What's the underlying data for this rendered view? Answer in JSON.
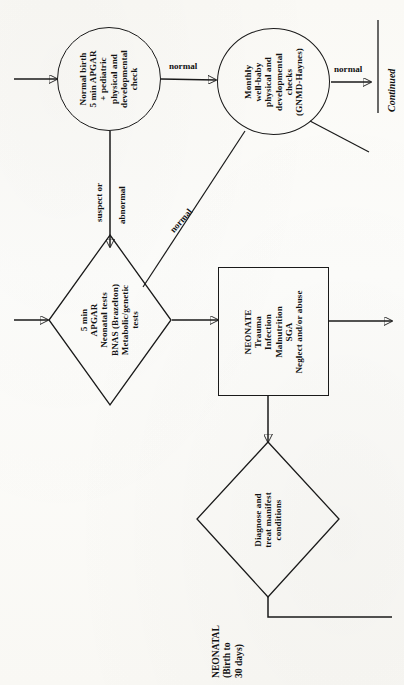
{
  "diagram": {
    "orientation": "text-rotated-90-counterclockwise",
    "ink_color": "#1a1a1a",
    "paper_color": "#fdfdfb",
    "nodes": [
      {
        "id": "normal-birth",
        "shape": "circle",
        "lines": [
          "Normal birth",
          "5 min APGAR",
          "+ pediatric",
          "physical and",
          "developmental",
          "check"
        ]
      },
      {
        "id": "monthly-checks",
        "shape": "circle",
        "lines": [
          "Monthly",
          "well-baby",
          "physical and",
          "developmental",
          "checks",
          "(GNMD-Haynes)"
        ]
      },
      {
        "id": "neonatal-tests",
        "shape": "diamond",
        "lines": [
          "5 min",
          "APGAR",
          "Neonatal tests",
          "BNAS (Brazelton)",
          "Metabolic/genetic",
          "tests"
        ]
      },
      {
        "id": "neonate-conditions",
        "shape": "rectangle",
        "lines": [
          "NEONATE",
          "Trauma",
          "Infection",
          "Malnutrition",
          "SGA",
          "Neglect and/or abuse"
        ]
      },
      {
        "id": "diagnose-treat",
        "shape": "diamond",
        "lines": [
          "Diagnose and",
          "treat manifest",
          "conditions"
        ]
      }
    ],
    "edge_labels": {
      "birth_to_monthly": "normal",
      "monthly_to_continued": "normal",
      "birth_to_tests_line1": "suspect or",
      "birth_to_tests_line2": "abnormal",
      "tests_to_monthly": "normal"
    },
    "continued": "Continued",
    "stage_label": {
      "lines": [
        "NEONATAL",
        "(Birth to",
        "30 days)"
      ]
    }
  }
}
